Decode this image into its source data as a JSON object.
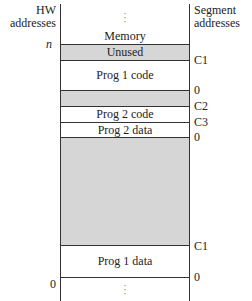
{
  "header": {
    "left_title_line1": "HW",
    "left_title_line2": "addresses",
    "right_title_line1": "Segment",
    "right_title_line2": "addresses"
  },
  "memory_label": "Memory",
  "ellipsis": ":",
  "hw_addresses": {
    "top": "n",
    "bottom": "0"
  },
  "segments": [
    {
      "label": "Unused",
      "fill": "#d6d6d6"
    },
    {
      "label": "Prog 1 code",
      "fill": "#ffffff"
    },
    {
      "label": "",
      "fill": "#d6d6d6"
    },
    {
      "label": "Prog 2 code",
      "fill": "#ffffff"
    },
    {
      "label": "Prog 2 data",
      "fill": "#ffffff"
    },
    {
      "label": "",
      "fill": "#d6d6d6"
    },
    {
      "label": "Prog 1 data",
      "fill": "#ffffff"
    }
  ],
  "segment_addresses": [
    "C1",
    "0",
    "C2",
    "C3",
    "0",
    "C1",
    "0"
  ]
}
